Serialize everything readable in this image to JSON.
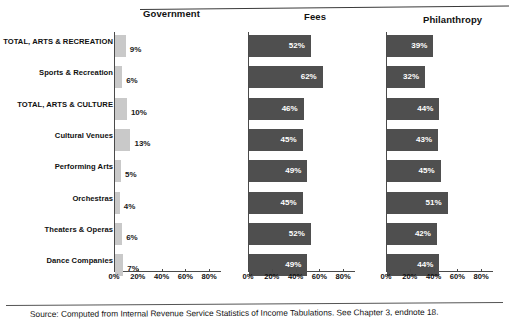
{
  "figure": {
    "panel_titles": {
      "government": "Government",
      "fees": "Fees",
      "philanthropy": "Philanthropy"
    },
    "source_note": "Source: Computed from Internal Revenue Service Statistics of Income Tabulations.  See Chapter 3, endnote 18.",
    "colors": {
      "light_bar": "#c9c9c9",
      "dark_bar": "#4f4f4f",
      "axis": "#4a4a4a",
      "text": "#111111",
      "inside_label": "#ffffff",
      "background": "#ffffff"
    }
  },
  "chart_data": {
    "type": "bar",
    "orientation": "horizontal",
    "title": "",
    "xlabel": "",
    "ylabel": "",
    "xlim": [
      0,
      90
    ],
    "grid": false,
    "legend": "none",
    "tick_labels": [
      "0%",
      "20%",
      "40%",
      "60%",
      "80%"
    ],
    "tick_values": [
      0,
      20,
      40,
      60,
      80
    ],
    "categories": [
      "TOTAL, ARTS & RECREATION",
      "Sports & Recreation",
      "TOTAL, ARTS & CULTURE",
      "Cultural Venues",
      "Performing Arts",
      "Orchestras",
      "Theaters & Operas",
      "Dance Companies"
    ],
    "series": [
      {
        "name": "Government",
        "values": [
          9,
          6,
          10,
          13,
          5,
          4,
          6,
          7
        ],
        "labels": [
          "9%",
          "6%",
          "10%",
          "13%",
          "5%",
          "4%",
          "6%",
          "7%"
        ],
        "bar_style": "light",
        "label_position": "outside"
      },
      {
        "name": "Fees",
        "values": [
          52,
          62,
          46,
          45,
          49,
          45,
          52,
          49
        ],
        "labels": [
          "52%",
          "62%",
          "46%",
          "45%",
          "49%",
          "45%",
          "52%",
          "49%"
        ],
        "bar_style": "dark",
        "label_position": "inside"
      },
      {
        "name": "Philanthropy",
        "values": [
          39,
          32,
          44,
          43,
          45,
          51,
          42,
          44
        ],
        "labels": [
          "39%",
          "32%",
          "44%",
          "43%",
          "45%",
          "51%",
          "42%",
          "44%"
        ],
        "bar_style": "dark",
        "label_position": "inside"
      }
    ]
  }
}
